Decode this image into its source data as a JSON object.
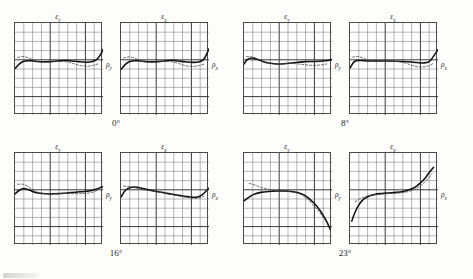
{
  "figure": {
    "background_color": "#fdfdfc",
    "curve_color": "#111111",
    "dashed_color": "#444444",
    "grid_minor_color": "#6b6b6b",
    "grid_major_color": "#3a3a3a",
    "rows": 2,
    "columns": 4
  },
  "groups": [
    {
      "angle_label": "0°",
      "panels": [
        {
          "y_axis_label": "ε",
          "y_axis_sub": "y",
          "x_axis_label": "ρ",
          "x_axis_sub": "y"
        },
        {
          "y_axis_label": "ε",
          "y_axis_sub": "x",
          "x_axis_label": "ρ",
          "x_axis_sub": "x"
        }
      ]
    },
    {
      "angle_label": "8°",
      "panels": [
        {
          "y_axis_label": "ε",
          "y_axis_sub": "y",
          "x_axis_label": "ρ",
          "x_axis_sub": "y"
        },
        {
          "y_axis_label": "ε",
          "y_axis_sub": "x",
          "x_axis_label": "ρ",
          "x_axis_sub": "x"
        }
      ]
    },
    {
      "angle_label": "16°",
      "panels": [
        {
          "y_axis_label": "ε",
          "y_axis_sub": "y",
          "x_axis_label": "ρ",
          "x_axis_sub": "y"
        },
        {
          "y_axis_label": "ε",
          "y_axis_sub": "x",
          "x_axis_label": "ρ",
          "x_axis_sub": "x"
        }
      ]
    },
    {
      "angle_label": "23°",
      "panels": [
        {
          "y_axis_label": "ε",
          "y_axis_sub": "y",
          "x_axis_label": "ρ",
          "x_axis_sub": "y"
        },
        {
          "y_axis_label": "ε",
          "y_axis_sub": "x",
          "x_axis_label": "ρ",
          "x_axis_sub": "x"
        }
      ]
    }
  ],
  "chart_data": [
    {
      "type": "line",
      "title": "0° — εy vs ρy",
      "xlabel": "ρy",
      "ylabel": "εy",
      "xlim": [
        0,
        10
      ],
      "ylim": [
        0,
        10
      ],
      "grid": true,
      "grid_major_every": 4,
      "legend": "none",
      "series": [
        {
          "name": "measured",
          "style": "solid",
          "x": [
            0.0,
            0.5,
            1.0,
            1.6,
            2.4,
            3.2,
            4.0,
            4.8,
            5.6,
            6.4,
            7.2,
            8.0,
            8.7,
            9.3,
            9.8,
            10.0
          ],
          "y": [
            5.05,
            5.55,
            5.85,
            5.9,
            5.83,
            5.78,
            5.8,
            5.86,
            5.92,
            5.88,
            5.8,
            5.74,
            5.78,
            6.05,
            6.7,
            7.15
          ]
        },
        {
          "name": "reference",
          "style": "dashed",
          "x": [
            0.3,
            1.0,
            1.8,
            2.6,
            3.4,
            4.2,
            5.0,
            5.8,
            6.6,
            7.4,
            8.2,
            8.9,
            9.4
          ],
          "y": [
            6.25,
            6.35,
            6.1,
            5.8,
            5.72,
            5.78,
            5.84,
            5.8,
            5.6,
            5.38,
            5.3,
            5.4,
            5.55
          ]
        }
      ]
    },
    {
      "type": "line",
      "title": "0° — εx vs ρx",
      "xlabel": "ρx",
      "ylabel": "εx",
      "xlim": [
        0,
        10
      ],
      "ylim": [
        0,
        10
      ],
      "grid": true,
      "grid_major_every": 4,
      "legend": "none",
      "series": [
        {
          "name": "measured",
          "style": "solid",
          "x": [
            0.0,
            0.5,
            1.0,
            1.7,
            2.5,
            3.3,
            4.1,
            4.9,
            5.7,
            6.5,
            7.3,
            8.1,
            8.8,
            9.4,
            9.8,
            10.0
          ],
          "y": [
            4.95,
            5.5,
            5.82,
            5.9,
            5.84,
            5.78,
            5.8,
            5.88,
            5.94,
            5.86,
            5.78,
            5.72,
            5.76,
            6.05,
            6.75,
            7.2
          ]
        },
        {
          "name": "reference",
          "style": "dashed",
          "x": [
            0.3,
            1.0,
            1.8,
            2.6,
            3.4,
            4.2,
            5.0,
            5.8,
            6.6,
            7.4,
            8.2,
            8.9,
            9.4
          ],
          "y": [
            6.2,
            6.32,
            6.08,
            5.78,
            5.7,
            5.76,
            5.82,
            5.78,
            5.58,
            5.34,
            5.28,
            5.38,
            5.52
          ]
        }
      ]
    },
    {
      "type": "line",
      "title": "8° — εy vs ρy",
      "xlabel": "ρy",
      "ylabel": "εy",
      "xlim": [
        0,
        10
      ],
      "ylim": [
        0,
        10
      ],
      "grid": true,
      "grid_major_every": 4,
      "legend": "none",
      "series": [
        {
          "name": "measured",
          "style": "solid",
          "x": [
            0.0,
            0.4,
            0.9,
            1.5,
            2.2,
            3.0,
            3.8,
            4.6,
            5.4,
            6.2,
            7.0,
            7.8,
            8.6,
            9.3,
            9.8,
            10.0
          ],
          "y": [
            5.55,
            6.05,
            6.2,
            6.05,
            5.8,
            5.62,
            5.55,
            5.58,
            5.66,
            5.74,
            5.8,
            5.82,
            5.84,
            5.9,
            5.98,
            6.05
          ]
        },
        {
          "name": "reference",
          "style": "dashed",
          "x": [
            0.3,
            1.0,
            1.8,
            2.6,
            3.4,
            4.2,
            5.0,
            5.8,
            6.6,
            7.4,
            8.2,
            8.9,
            9.4
          ],
          "y": [
            6.35,
            6.3,
            6.0,
            5.72,
            5.58,
            5.56,
            5.6,
            5.58,
            5.5,
            5.42,
            5.4,
            5.46,
            5.55
          ]
        }
      ]
    },
    {
      "type": "line",
      "title": "8° — εx vs ρx",
      "xlabel": "ρx",
      "ylabel": "εx",
      "xlim": [
        0,
        10
      ],
      "ylim": [
        0,
        10
      ],
      "grid": true,
      "grid_major_every": 4,
      "legend": "none",
      "series": [
        {
          "name": "measured",
          "style": "solid",
          "x": [
            0.0,
            0.4,
            0.8,
            1.3,
            2.0,
            2.8,
            3.6,
            4.4,
            5.2,
            6.0,
            6.8,
            7.6,
            8.3,
            9.0,
            9.5,
            10.0
          ],
          "y": [
            5.1,
            5.72,
            5.92,
            5.92,
            5.88,
            5.86,
            5.86,
            5.86,
            5.85,
            5.82,
            5.78,
            5.7,
            5.66,
            5.8,
            6.4,
            7.1
          ]
        },
        {
          "name": "reference",
          "style": "dashed",
          "x": [
            0.3,
            1.0,
            1.8,
            2.6,
            3.4,
            4.2,
            5.0,
            5.8,
            6.6,
            7.4,
            8.2,
            8.9,
            9.4
          ],
          "y": [
            6.3,
            6.35,
            6.05,
            5.85,
            5.82,
            5.84,
            5.84,
            5.76,
            5.55,
            5.3,
            5.22,
            5.32,
            5.58
          ]
        }
      ]
    },
    {
      "type": "line",
      "title": "16° — εy vs ρy",
      "xlabel": "ρy",
      "ylabel": "εy",
      "xlim": [
        0,
        10
      ],
      "ylim": [
        0,
        10
      ],
      "grid": true,
      "grid_major_every": 4,
      "legend": "none",
      "series": [
        {
          "name": "measured",
          "style": "solid",
          "x": [
            0.0,
            0.5,
            1.0,
            1.6,
            2.3,
            3.1,
            3.9,
            4.7,
            5.5,
            6.3,
            7.1,
            7.9,
            8.6,
            9.2,
            9.7,
            10.0
          ],
          "y": [
            5.55,
            5.95,
            6.15,
            5.98,
            5.72,
            5.6,
            5.55,
            5.58,
            5.62,
            5.7,
            5.76,
            5.82,
            5.9,
            6.05,
            6.25,
            6.35
          ]
        },
        {
          "name": "reference",
          "style": "dashed",
          "x": [
            0.3,
            1.0,
            1.8,
            2.6,
            3.4,
            4.2,
            5.0,
            5.8,
            6.6,
            7.4,
            8.2,
            8.9,
            9.4
          ],
          "y": [
            6.6,
            6.58,
            6.15,
            5.72,
            5.58,
            5.56,
            5.58,
            5.6,
            5.58,
            5.58,
            5.62,
            5.75,
            5.95
          ]
        }
      ]
    },
    {
      "type": "line",
      "title": "16° — εx vs ρx",
      "xlabel": "ρx",
      "ylabel": "εx",
      "xlim": [
        0,
        10
      ],
      "ylim": [
        0,
        10
      ],
      "grid": true,
      "grid_major_every": 4,
      "legend": "none",
      "series": [
        {
          "name": "measured",
          "style": "solid",
          "x": [
            0.0,
            0.5,
            1.1,
            1.8,
            2.6,
            3.4,
            4.2,
            5.0,
            5.8,
            6.6,
            7.4,
            8.1,
            8.7,
            9.2,
            9.7,
            10.0
          ],
          "y": [
            5.2,
            5.95,
            6.25,
            6.28,
            6.12,
            5.95,
            5.8,
            5.66,
            5.52,
            5.4,
            5.28,
            5.2,
            5.22,
            5.45,
            5.9,
            6.2
          ]
        },
        {
          "name": "reference",
          "style": "dashed",
          "x": [
            0.3,
            1.0,
            1.8,
            2.6,
            3.4,
            4.2,
            5.0,
            5.8,
            6.6,
            7.4,
            8.2,
            8.9,
            9.4
          ],
          "y": [
            6.4,
            6.35,
            6.18,
            6.0,
            5.88,
            5.76,
            5.62,
            5.48,
            5.32,
            5.18,
            5.08,
            5.12,
            5.3
          ]
        }
      ]
    },
    {
      "type": "line",
      "title": "23° — εy vs ρy",
      "xlabel": "ρy",
      "ylabel": "εy",
      "xlim": [
        0,
        10
      ],
      "ylim": [
        0,
        10
      ],
      "grid": true,
      "grid_major_every": 4,
      "legend": "none",
      "series": [
        {
          "name": "measured",
          "style": "solid",
          "x": [
            0.0,
            0.5,
            1.1,
            1.9,
            2.8,
            3.7,
            4.6,
            5.4,
            6.1,
            6.8,
            7.4,
            8.0,
            8.6,
            9.1,
            9.5,
            9.8
          ],
          "y": [
            4.8,
            5.15,
            5.5,
            5.72,
            5.82,
            5.86,
            5.86,
            5.82,
            5.7,
            5.45,
            5.05,
            4.5,
            3.8,
            3.05,
            2.35,
            1.7
          ]
        },
        {
          "name": "reference",
          "style": "dashed",
          "x": [
            0.6,
            1.3,
            2.0,
            2.8,
            3.6,
            4.4,
            5.2,
            6.0,
            6.7,
            7.3,
            7.9,
            8.5,
            9.0,
            9.4
          ],
          "y": [
            6.7,
            6.5,
            6.25,
            6.05,
            5.92,
            5.86,
            5.8,
            5.65,
            5.35,
            4.9,
            4.3,
            3.65,
            3.0,
            2.45
          ]
        }
      ]
    },
    {
      "type": "line",
      "title": "23° — εx vs ρx",
      "xlabel": "ρx",
      "ylabel": "εx",
      "xlim": [
        0,
        10
      ],
      "ylim": [
        0,
        10
      ],
      "grid": true,
      "grid_major_every": 4,
      "legend": "none",
      "series": [
        {
          "name": "measured",
          "style": "solid",
          "x": [
            0.2,
            0.5,
            0.9,
            1.4,
            2.0,
            2.8,
            3.6,
            4.4,
            5.2,
            6.0,
            6.7,
            7.4,
            8.0,
            8.6,
            9.1,
            9.5
          ],
          "y": [
            2.6,
            3.4,
            4.2,
            4.85,
            5.25,
            5.5,
            5.6,
            5.66,
            5.72,
            5.82,
            6.0,
            6.3,
            6.75,
            7.35,
            8.0,
            8.45
          ]
        },
        {
          "name": "reference",
          "style": "dashed",
          "x": [
            0.6,
            1.2,
            1.9,
            2.7,
            3.5,
            4.3,
            5.1,
            5.9,
            6.6,
            7.2,
            7.8,
            8.4,
            8.9,
            9.3
          ],
          "y": [
            4.7,
            5.05,
            5.3,
            5.45,
            5.52,
            5.58,
            5.62,
            5.68,
            5.8,
            6.0,
            6.3,
            6.75,
            7.25,
            7.75
          ]
        }
      ]
    }
  ]
}
